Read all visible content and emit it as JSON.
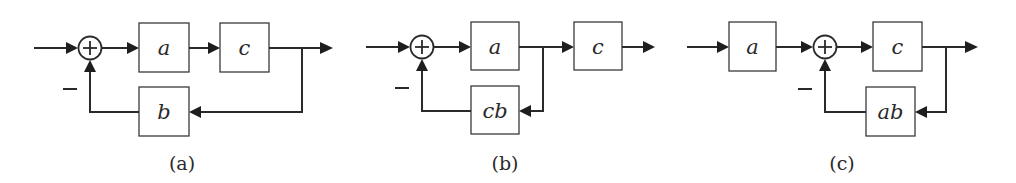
{
  "figure": {
    "diagrams": [
      {
        "caption": "(a)",
        "blocks": [
          {
            "id": "a",
            "label": "a",
            "path": "forward"
          },
          {
            "id": "c",
            "label": "c",
            "path": "forward"
          },
          {
            "id": "b",
            "label": "b",
            "path": "feedback"
          }
        ],
        "summing_junction": {
          "sign_input": "+",
          "feedback_sign": "−"
        },
        "structure": "input → Σ → a → c → output; output → b → Σ (−)"
      },
      {
        "caption": "(b)",
        "blocks": [
          {
            "id": "a",
            "label": "a",
            "path": "forward"
          },
          {
            "id": "c",
            "label": "c",
            "path": "forward"
          },
          {
            "id": "cb",
            "label": "cb",
            "path": "feedback"
          }
        ],
        "summing_junction": {
          "sign_input": "+",
          "feedback_sign": "−"
        },
        "structure": "input → Σ → a → c → output; a-output → cb → Σ (−)"
      },
      {
        "caption": "(c)",
        "blocks": [
          {
            "id": "a",
            "label": "a",
            "path": "forward"
          },
          {
            "id": "c",
            "label": "c",
            "path": "forward"
          },
          {
            "id": "ab",
            "label": "ab",
            "path": "feedback"
          }
        ],
        "summing_junction": {
          "sign_input": "+",
          "feedback_sign": "−"
        },
        "structure": "input → a → Σ → c → output; output → ab → Σ (−)"
      }
    ],
    "plus_symbol": "+",
    "minus_symbol": "−"
  }
}
